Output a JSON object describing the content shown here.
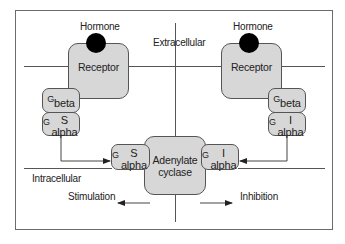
{
  "diagram": {
    "regions": {
      "extracellular": "Extracellular",
      "intracellular": "Intracellular"
    },
    "left_pathway": {
      "hormone": "Hormone",
      "receptor": "Receptor",
      "g_beta": {
        "base": "G",
        "sub": "beta"
      },
      "g_alpha": {
        "base": "G",
        "sub": "S alpha"
      },
      "effect": "Stimulation"
    },
    "right_pathway": {
      "hormone": "Hormone",
      "receptor": "Receptor",
      "g_beta": {
        "base": "G",
        "sub": "beta"
      },
      "g_alpha": {
        "base": "G",
        "sub": "I alpha"
      },
      "effect": "Inhibition"
    },
    "center": {
      "enzyme_line1": "Adenylate",
      "enzyme_line2": "cyclase",
      "gs_alpha": {
        "base": "G",
        "sub": "S alpha"
      },
      "gi_alpha": {
        "base": "G",
        "sub": "I alpha"
      }
    },
    "colors": {
      "box_fill": "#d7d7d7",
      "line": "#555555",
      "hormone": "#000000"
    }
  }
}
